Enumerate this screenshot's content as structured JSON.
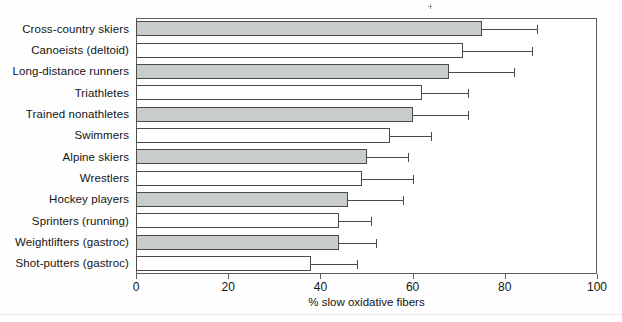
{
  "chart_data": {
    "type": "bar",
    "orientation": "horizontal",
    "title": "",
    "xlabel": "% slow oxidative fibers",
    "ylabel": "",
    "xlim": [
      0,
      100
    ],
    "xticks": [
      0,
      20,
      40,
      60,
      80,
      100
    ],
    "xtick_labels": [
      "0",
      "20",
      "40",
      "60",
      "80",
      "100"
    ],
    "grid": false,
    "legend": false,
    "categories": [
      "Cross-country skiers",
      "Canoeists (deltoid)",
      "Long-distance runners",
      "Triathletes",
      "Trained nonathletes",
      "Swimmers",
      "Alpine skiers",
      "Wrestlers",
      "Hockey players",
      "Sprinters (running)",
      "Weightlifters (gastroc)",
      "Shot-putters (gastroc)"
    ],
    "values": [
      75,
      71,
      68,
      62,
      60,
      55,
      50,
      49,
      46,
      44,
      44,
      38
    ],
    "error_high": [
      87,
      86,
      82,
      72,
      72,
      64,
      59,
      60,
      58,
      51,
      52,
      48
    ],
    "bar_styles": [
      "filled",
      "hollow",
      "filled",
      "hollow",
      "filled",
      "hollow",
      "filled",
      "hollow",
      "filled",
      "hollow",
      "filled",
      "hollow"
    ],
    "colors": {
      "fill_gray": "#c9cdc9",
      "fill_white": "#ffffff",
      "outline": "#4a4a4a",
      "axis": "#5d5d5d",
      "text": "#141414"
    }
  }
}
